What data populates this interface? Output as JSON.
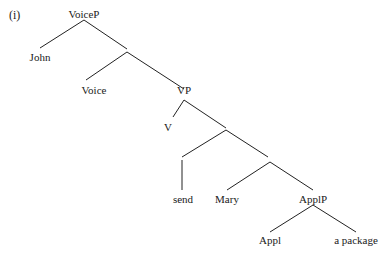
{
  "example_label": "(i)",
  "nodes": {
    "voicep": "VoiceP",
    "john": "John",
    "voice": "Voice",
    "vp": "VP",
    "v": "V",
    "send": "send",
    "mary": "Mary",
    "applp": "ApplP",
    "appl": "Appl",
    "package": "a package"
  }
}
